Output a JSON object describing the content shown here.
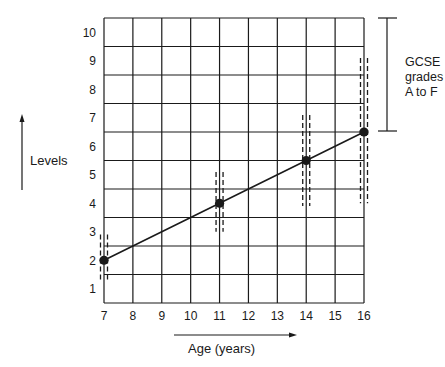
{
  "chart_data": {
    "type": "line",
    "title": "",
    "xlabel": "Age (years)",
    "ylabel": "Levels",
    "x_ticks": [
      7,
      8,
      9,
      10,
      11,
      12,
      13,
      14,
      15,
      16
    ],
    "y_ticks": [
      1,
      2,
      3,
      4,
      5,
      6,
      7,
      8,
      9,
      10
    ],
    "xlim": [
      7,
      16
    ],
    "ylim": [
      0.5,
      10.5
    ],
    "grid": true,
    "series": [
      {
        "name": "Typical attainment",
        "x": [
          7,
          11,
          14,
          16
        ],
        "y": [
          2,
          4,
          5.5,
          6.5
        ]
      }
    ],
    "ranges": [
      {
        "age": 7,
        "low": 1.25,
        "high": 2.9
      },
      {
        "age": 11,
        "low": 3.0,
        "high": 5.1
      },
      {
        "age": 14,
        "low": 3.9,
        "high": 7.1
      },
      {
        "age": 16,
        "low": 4.0,
        "high": 9.1
      }
    ],
    "annotations": [
      {
        "text": "GCSE grades A to F",
        "spans_levels": [
          6.5,
          10.5
        ]
      }
    ]
  },
  "labels": {
    "ylabel": "Levels",
    "xlabel": "Age (years)",
    "gcse_line1": "GCSE",
    "gcse_line2": "grades",
    "gcse_line3": "A to F"
  },
  "colors": {
    "ink": "#1a1a1a",
    "background": "#ffffff"
  }
}
